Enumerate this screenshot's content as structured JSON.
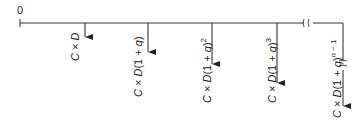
{
  "diagram": {
    "origin_label": "0",
    "timeline": {
      "color": "#333333",
      "break_mark": "≈"
    },
    "cashflows": [
      {
        "label": "C × D",
        "expr": {
          "pre": "C",
          "times": " × ",
          "var": "D",
          "paren": "",
          "exp": ""
        }
      },
      {
        "label": "C × D(1 + q)",
        "expr": {
          "pre": "C",
          "times": " × ",
          "var": "D",
          "paren": "(1 + q)",
          "exp": ""
        }
      },
      {
        "label": "C × D(1 + q)^2",
        "expr": {
          "pre": "C",
          "times": " × ",
          "var": "D",
          "paren": "(1 + q)",
          "exp": "2"
        }
      },
      {
        "label": "C × D(1 + q)^3",
        "expr": {
          "pre": "C",
          "times": " × ",
          "var": "D",
          "paren": "(1 + q)",
          "exp": "3"
        }
      },
      {
        "label": "C × D(1 + q)^(n − 1)",
        "expr": {
          "pre": "C",
          "times": " × ",
          "var": "D",
          "paren": "(1 + q)",
          "exp": "n − 1"
        }
      }
    ]
  }
}
